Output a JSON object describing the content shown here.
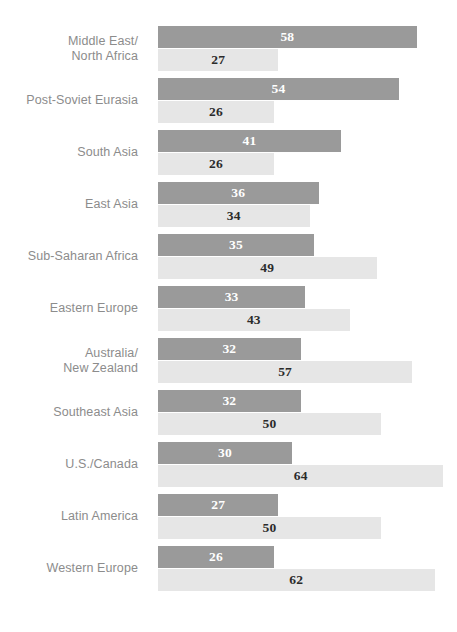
{
  "chart_data": {
    "type": "bar",
    "orientation": "horizontal",
    "title": "",
    "subtitle": "",
    "xlabel": "",
    "ylabel": "",
    "xlim": [
      0,
      67
    ],
    "grid": false,
    "legend": null,
    "categories": [
      "Middle East/\nNorth Africa",
      "Post-Soviet Eurasia",
      "South Asia",
      "East Asia",
      "Sub-Saharan Africa",
      "Eastern Europe",
      "Australia/\nNew Zealand",
      "Southeast Asia",
      "U.S./Canada",
      "Latin America",
      "Western Europe"
    ],
    "series": [
      {
        "name": "series-1",
        "color": "#9a9a9a",
        "values": [
          58,
          54,
          41,
          36,
          35,
          33,
          32,
          32,
          30,
          27,
          26
        ]
      },
      {
        "name": "series-2",
        "color": "#e6e6e6",
        "values": [
          27,
          26,
          26,
          34,
          49,
          43,
          57,
          50,
          64,
          50,
          62
        ]
      }
    ]
  },
  "rows": [
    {
      "label_lines": [
        "Middle East/",
        "North Africa"
      ],
      "primary": 58,
      "secondary": 27
    },
    {
      "label_lines": [
        "Post-Soviet Eurasia"
      ],
      "primary": 54,
      "secondary": 26
    },
    {
      "label_lines": [
        "South Asia"
      ],
      "primary": 41,
      "secondary": 26
    },
    {
      "label_lines": [
        "East Asia"
      ],
      "primary": 36,
      "secondary": 34
    },
    {
      "label_lines": [
        "Sub-Saharan Africa"
      ],
      "primary": 35,
      "secondary": 49
    },
    {
      "label_lines": [
        "Eastern Europe"
      ],
      "primary": 33,
      "secondary": 43
    },
    {
      "label_lines": [
        "Australia/",
        "New Zealand"
      ],
      "primary": 32,
      "secondary": 57
    },
    {
      "label_lines": [
        "Southeast Asia"
      ],
      "primary": 32,
      "secondary": 50
    },
    {
      "label_lines": [
        "U.S./Canada"
      ],
      "primary": 30,
      "secondary": 64
    },
    {
      "label_lines": [
        "Latin America"
      ],
      "primary": 27,
      "secondary": 50
    },
    {
      "label_lines": [
        "Western Europe"
      ],
      "primary": 26,
      "secondary": 62
    }
  ],
  "style": {
    "primary_color": "#9a9a9a",
    "secondary_color": "#e6e6e6",
    "primary_value_color": "#ffffff",
    "secondary_value_color": "#2b2b2b",
    "label_color": "#8c8c8c",
    "background_color": "#ffffff"
  },
  "geometry": {
    "bars_left_px": 158,
    "px_per_unit": 4.46,
    "row_top_px": 26,
    "row_pitch_px": 52,
    "bar_height_px": 22,
    "bar_gap_px": 1
  }
}
